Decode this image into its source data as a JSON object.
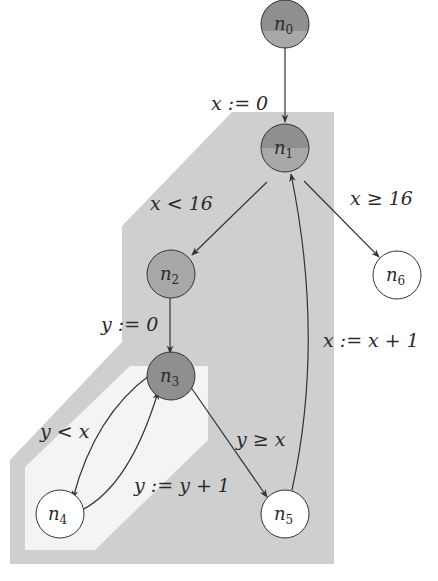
{
  "diagram": {
    "type": "control-flow-graph",
    "colors": {
      "outer_region": "#cfcfcf",
      "inner_region": "#f4f4f4",
      "node_dark": "#8f8f8f",
      "node_mid": "#a8a8a8",
      "node_white": "#ffffff",
      "stroke": "#333333"
    },
    "nodes": [
      {
        "id": "n0",
        "base": "n",
        "sub": "0",
        "style": "half-dark"
      },
      {
        "id": "n1",
        "base": "n",
        "sub": "1",
        "style": "half-dark"
      },
      {
        "id": "n2",
        "base": "n",
        "sub": "2",
        "style": "mid"
      },
      {
        "id": "n3",
        "base": "n",
        "sub": "3",
        "style": "dark"
      },
      {
        "id": "n4",
        "base": "n",
        "sub": "4",
        "style": "white"
      },
      {
        "id": "n5",
        "base": "n",
        "sub": "5",
        "style": "white"
      },
      {
        "id": "n6",
        "base": "n",
        "sub": "6",
        "style": "white"
      }
    ],
    "edges": [
      {
        "from": "n0",
        "to": "n1",
        "label": "x := 0"
      },
      {
        "from": "n1",
        "to": "n2",
        "label": "x < 16"
      },
      {
        "from": "n1",
        "to": "n6",
        "label": "x ≥ 16"
      },
      {
        "from": "n2",
        "to": "n3",
        "label": "y := 0"
      },
      {
        "from": "n3",
        "to": "n4",
        "label": "y < x"
      },
      {
        "from": "n4",
        "to": "n3",
        "label": "y := y + 1"
      },
      {
        "from": "n3",
        "to": "n5",
        "label": "y ≥ x"
      },
      {
        "from": "n5",
        "to": "n1",
        "label": "x := x + 1"
      }
    ],
    "labels": {
      "e01": "x := 0",
      "e12": "x < 16",
      "e16": "x ≥ 16",
      "e23": "y := 0",
      "e34": "y < x",
      "e43": "y := y + 1",
      "e35": "y ≥ x",
      "e51": "x := x + 1"
    },
    "node_labels": {
      "n0": {
        "base": "n",
        "sub": "0"
      },
      "n1": {
        "base": "n",
        "sub": "1"
      },
      "n2": {
        "base": "n",
        "sub": "2"
      },
      "n3": {
        "base": "n",
        "sub": "3"
      },
      "n4": {
        "base": "n",
        "sub": "4"
      },
      "n5": {
        "base": "n",
        "sub": "5"
      },
      "n6": {
        "base": "n",
        "sub": "6"
      }
    }
  }
}
